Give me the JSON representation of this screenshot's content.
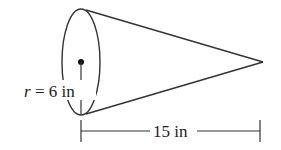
{
  "diagram": {
    "type": "cone",
    "radius_label": {
      "variable": "r",
      "equals": " = ",
      "value": "6",
      "unit": " in"
    },
    "length_label": {
      "value": "15",
      "unit": " in"
    },
    "colors": {
      "stroke": "#333333",
      "text": "#222222",
      "background": "#ffffff"
    }
  }
}
